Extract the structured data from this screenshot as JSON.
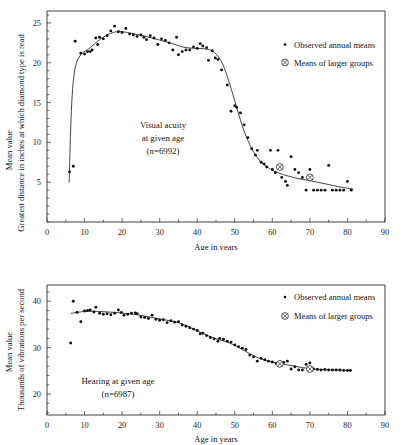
{
  "figure": {
    "background": "#ffffff",
    "ink": "#1a1a1a"
  },
  "legend": {
    "observed_label": "Observed annual means",
    "group_label": "Means of larger groups",
    "observed_icon": "small-dot-icon",
    "group_icon": "circled-cross-icon"
  },
  "panels": [
    {
      "id": "visual-acuity",
      "annotation_lines": [
        "Visual acuity",
        "at given age",
        "(n=6992)"
      ],
      "ylabel_outer": "Mean value",
      "ylabel_inner": "Greatest distance in inches at which diamond type is read",
      "xlabel": "Age in years",
      "x_ticks": [
        "0",
        "10",
        "20",
        "30",
        "40",
        "50",
        "60",
        "70",
        "80",
        "90"
      ],
      "y_ticks": [
        "5",
        "10",
        "15",
        "20",
        "25"
      ]
    },
    {
      "id": "hearing",
      "annotation_lines": [
        "Hearing at given age",
        "(n=6987)"
      ],
      "ylabel_outer": "Mean value",
      "ylabel_inner": "Thousands of vibrations per second",
      "xlabel": "Age in years",
      "x_ticks": [
        "0",
        "10",
        "20",
        "30",
        "40",
        "50",
        "60",
        "70",
        "80",
        "90"
      ],
      "y_ticks": [
        "20",
        "30",
        "40"
      ]
    }
  ],
  "chart_data": [
    {
      "type": "scatter",
      "title": "Visual acuity at given age (n=6992)",
      "xlabel": "Age in years",
      "ylabel": "Greatest distance in inches at which diamond type is read",
      "ylabel_secondary": "Mean value",
      "xlim": [
        0,
        90
      ],
      "ylim": [
        0,
        26.5
      ],
      "xticks": [
        0,
        10,
        20,
        30,
        40,
        50,
        60,
        70,
        80,
        90
      ],
      "yticks": [
        5,
        10,
        15,
        20,
        25
      ],
      "minor_tick_step_x": 5,
      "minor_tick_step_y": 1,
      "grid": false,
      "legend": [
        "Observed annual means",
        "Means of larger groups"
      ],
      "legend_position": "upper-right-inside",
      "series": [
        {
          "name": "Observed annual means",
          "marker": "dot",
          "points": [
            [
              6.0,
              6.3
            ],
            [
              7.0,
              7.0
            ],
            [
              7.5,
              22.7
            ],
            [
              9.0,
              21.2
            ],
            [
              10.0,
              21.1
            ],
            [
              10.8,
              21.4
            ],
            [
              11.5,
              21.4
            ],
            [
              12.0,
              21.6
            ],
            [
              13.0,
              23.1
            ],
            [
              13.5,
              22.3
            ],
            [
              14.0,
              23.2
            ],
            [
              15.0,
              23.0
            ],
            [
              16.0,
              23.4
            ],
            [
              17.0,
              24.0
            ],
            [
              18.0,
              24.6
            ],
            [
              19.0,
              23.9
            ],
            [
              20.0,
              23.8
            ],
            [
              21.0,
              24.3
            ],
            [
              22.0,
              23.6
            ],
            [
              23.0,
              23.5
            ],
            [
              24.0,
              23.3
            ],
            [
              25.0,
              23.5
            ],
            [
              25.8,
              23.2
            ],
            [
              26.5,
              22.9
            ],
            [
              27.5,
              23.4
            ],
            [
              28.5,
              23.1
            ],
            [
              29.5,
              22.3
            ],
            [
              30.5,
              23.0
            ],
            [
              31.5,
              22.8
            ],
            [
              32.5,
              22.5
            ],
            [
              33.5,
              21.6
            ],
            [
              34.5,
              23.2
            ],
            [
              35.0,
              21.0
            ],
            [
              36.0,
              21.4
            ],
            [
              37.0,
              21.6
            ],
            [
              38.0,
              21.6
            ],
            [
              39.0,
              22.0
            ],
            [
              40.0,
              21.8
            ],
            [
              40.8,
              22.4
            ],
            [
              41.5,
              22.1
            ],
            [
              42.5,
              21.9
            ],
            [
              43.0,
              20.3
            ],
            [
              44.0,
              21.5
            ],
            [
              44.8,
              20.6
            ],
            [
              45.5,
              20.4
            ],
            [
              46.5,
              19.1
            ],
            [
              48.0,
              17.2
            ],
            [
              49.0,
              13.9
            ],
            [
              50.0,
              14.6
            ],
            [
              50.5,
              14.4
            ],
            [
              51.5,
              13.7
            ],
            [
              52.5,
              12.2
            ],
            [
              53.5,
              10.6
            ],
            [
              54.5,
              9.2
            ],
            [
              55.5,
              8.4
            ],
            [
              56.0,
              9.0
            ],
            [
              57.0,
              7.5
            ],
            [
              57.8,
              7.3
            ],
            [
              58.5,
              6.9
            ],
            [
              59.5,
              9.0
            ],
            [
              60.0,
              6.6
            ],
            [
              60.8,
              6.2
            ],
            [
              61.5,
              9.0
            ],
            [
              62.5,
              5.6
            ],
            [
              63.5,
              5.1
            ],
            [
              64.0,
              4.6
            ],
            [
              65.0,
              8.2
            ],
            [
              66.0,
              6.6
            ],
            [
              67.0,
              6.2
            ],
            [
              68.0,
              5.6
            ],
            [
              69.0,
              4.0
            ],
            [
              70.0,
              6.6
            ],
            [
              71.0,
              4.0
            ],
            [
              72.0,
              4.0
            ],
            [
              73.0,
              4.0
            ],
            [
              74.0,
              4.0
            ],
            [
              75.0,
              7.1
            ],
            [
              76.0,
              4.0
            ],
            [
              77.0,
              4.0
            ],
            [
              78.0,
              4.0
            ],
            [
              79.0,
              4.0
            ],
            [
              80.0,
              5.1
            ],
            [
              81.0,
              4.0
            ]
          ]
        },
        {
          "name": "Means of larger groups",
          "marker": "circled-cross",
          "points": [
            [
              62.0,
              6.9
            ],
            [
              70.0,
              5.6
            ]
          ]
        }
      ],
      "fitted_curve": [
        [
          5.9,
          5.0
        ],
        [
          6.1,
          8.5
        ],
        [
          6.4,
          13.0
        ],
        [
          6.8,
          16.6
        ],
        [
          7.3,
          18.8
        ],
        [
          8.0,
          20.2
        ],
        [
          9.0,
          21.0
        ],
        [
          10.0,
          21.4
        ],
        [
          11.0,
          21.7
        ],
        [
          12.0,
          22.1
        ],
        [
          13.0,
          22.5
        ],
        [
          14.0,
          22.9
        ],
        [
          15.0,
          23.2
        ],
        [
          16.0,
          23.5
        ],
        [
          17.0,
          23.7
        ],
        [
          18.0,
          23.85
        ],
        [
          19.0,
          23.9
        ],
        [
          20.0,
          23.9
        ],
        [
          22.0,
          23.75
        ],
        [
          24.0,
          23.55
        ],
        [
          26.0,
          23.35
        ],
        [
          28.0,
          23.1
        ],
        [
          30.0,
          22.85
        ],
        [
          32.0,
          22.6
        ],
        [
          34.0,
          22.3
        ],
        [
          36.0,
          22.0
        ],
        [
          38.0,
          21.85
        ],
        [
          40.0,
          21.8
        ],
        [
          42.0,
          21.75
        ],
        [
          44.0,
          21.5
        ],
        [
          45.0,
          21.1
        ],
        [
          46.0,
          20.5
        ],
        [
          47.0,
          19.6
        ],
        [
          48.0,
          18.3
        ],
        [
          49.0,
          16.8
        ],
        [
          50.0,
          15.2
        ],
        [
          51.0,
          13.6
        ],
        [
          52.0,
          12.1
        ],
        [
          53.0,
          10.8
        ],
        [
          54.0,
          9.7
        ],
        [
          55.0,
          8.8
        ],
        [
          56.0,
          8.1
        ],
        [
          57.0,
          7.5
        ],
        [
          58.0,
          7.1
        ],
        [
          59.0,
          6.8
        ],
        [
          60.0,
          6.5
        ],
        [
          62.0,
          6.1
        ],
        [
          64.0,
          5.8
        ],
        [
          66.0,
          5.55
        ],
        [
          68.0,
          5.35
        ],
        [
          70.0,
          5.2
        ],
        [
          72.0,
          5.0
        ],
        [
          74.0,
          4.8
        ],
        [
          76.0,
          4.6
        ],
        [
          78.0,
          4.4
        ],
        [
          80.0,
          4.25
        ],
        [
          81.5,
          4.15
        ]
      ]
    },
    {
      "type": "scatter",
      "title": "Hearing at given age (n=6987)",
      "xlabel": "Age in years",
      "ylabel": "Thousands of vibrations per second",
      "ylabel_secondary": "Mean value",
      "xlim": [
        0,
        90
      ],
      "ylim": [
        15.5,
        43.5
      ],
      "xticks": [
        0,
        10,
        20,
        30,
        40,
        50,
        60,
        70,
        80,
        90
      ],
      "yticks": [
        20,
        30,
        40
      ],
      "minor_tick_step_x": 5,
      "minor_tick_step_y": 2,
      "grid": false,
      "legend": [
        "Observed annual means",
        "Means of larger groups"
      ],
      "legend_position": "upper-right-inside",
      "series": [
        {
          "name": "Observed annual means",
          "marker": "dot",
          "points": [
            [
              6.3,
              31.0
            ],
            [
              7.0,
              40.0
            ],
            [
              8.0,
              37.6
            ],
            [
              9.0,
              35.6
            ],
            [
              10.0,
              37.9
            ],
            [
              10.8,
              38.0
            ],
            [
              11.5,
              38.1
            ],
            [
              12.5,
              37.7
            ],
            [
              13.0,
              38.7
            ],
            [
              14.0,
              37.4
            ],
            [
              15.0,
              37.2
            ],
            [
              16.0,
              37.3
            ],
            [
              17.0,
              37.1
            ],
            [
              18.0,
              37.4
            ],
            [
              19.0,
              38.1
            ],
            [
              19.8,
              37.6
            ],
            [
              20.5,
              37.0
            ],
            [
              21.5,
              37.2
            ],
            [
              22.5,
              37.4
            ],
            [
              23.5,
              37.5
            ],
            [
              24.0,
              37.3
            ],
            [
              25.0,
              36.6
            ],
            [
              26.0,
              36.5
            ],
            [
              27.0,
              36.3
            ],
            [
              28.0,
              37.0
            ],
            [
              29.0,
              36.1
            ],
            [
              30.0,
              35.9
            ],
            [
              31.0,
              36.0
            ],
            [
              32.0,
              35.4
            ],
            [
              33.0,
              35.8
            ],
            [
              34.0,
              35.5
            ],
            [
              35.0,
              35.6
            ],
            [
              36.0,
              34.9
            ],
            [
              37.0,
              34.6
            ],
            [
              38.0,
              34.3
            ],
            [
              39.0,
              34.0
            ],
            [
              40.0,
              33.7
            ],
            [
              40.8,
              33.0
            ],
            [
              41.5,
              33.1
            ],
            [
              42.5,
              32.6
            ],
            [
              43.5,
              32.2
            ],
            [
              44.5,
              31.9
            ],
            [
              45.5,
              31.4
            ],
            [
              46.0,
              32.0
            ],
            [
              47.0,
              31.8
            ],
            [
              48.0,
              31.4
            ],
            [
              49.0,
              31.2
            ],
            [
              50.0,
              30.6
            ],
            [
              51.0,
              30.2
            ],
            [
              52.0,
              29.9
            ],
            [
              53.0,
              29.6
            ],
            [
              54.0,
              28.4
            ],
            [
              55.0,
              28.0
            ],
            [
              56.0,
              27.1
            ],
            [
              57.0,
              27.7
            ],
            [
              58.0,
              27.4
            ],
            [
              59.0,
              27.1
            ],
            [
              60.0,
              26.9
            ],
            [
              61.0,
              26.6
            ],
            [
              62.0,
              27.0
            ],
            [
              63.0,
              26.8
            ],
            [
              64.0,
              27.1
            ],
            [
              65.0,
              25.4
            ],
            [
              66.0,
              25.9
            ],
            [
              67.0,
              25.2
            ],
            [
              68.0,
              25.2
            ],
            [
              69.0,
              26.4
            ],
            [
              70.0,
              26.7
            ],
            [
              71.0,
              25.4
            ],
            [
              72.0,
              25.3
            ],
            [
              73.0,
              25.2
            ],
            [
              74.0,
              25.3
            ],
            [
              75.0,
              25.2
            ],
            [
              76.0,
              25.2
            ],
            [
              77.0,
              25.2
            ],
            [
              78.0,
              25.2
            ],
            [
              79.0,
              25.1
            ],
            [
              80.0,
              25.1
            ],
            [
              80.8,
              25.1
            ]
          ]
        },
        {
          "name": "Means of larger groups",
          "marker": "circled-cross",
          "points": [
            [
              62.0,
              26.5
            ],
            [
              70.0,
              25.4
            ]
          ]
        }
      ],
      "fitted_curve": [
        [
          6.5,
          37.4
        ],
        [
          8.0,
          37.6
        ],
        [
          10.0,
          37.8
        ],
        [
          12.0,
          37.85
        ],
        [
          14.0,
          37.8
        ],
        [
          16.0,
          37.7
        ],
        [
          18.0,
          37.6
        ],
        [
          20.0,
          37.45
        ],
        [
          22.0,
          37.3
        ],
        [
          24.0,
          37.1
        ],
        [
          26.0,
          36.8
        ],
        [
          28.0,
          36.5
        ],
        [
          30.0,
          36.2
        ],
        [
          32.0,
          35.9
        ],
        [
          34.0,
          35.6
        ],
        [
          36.0,
          35.1
        ],
        [
          38.0,
          34.4
        ],
        [
          40.0,
          33.6
        ],
        [
          42.0,
          32.9
        ],
        [
          44.0,
          32.2
        ],
        [
          46.0,
          31.7
        ],
        [
          48.0,
          31.2
        ],
        [
          50.0,
          30.5
        ],
        [
          52.0,
          29.6
        ],
        [
          54.0,
          28.7
        ],
        [
          56.0,
          27.9
        ],
        [
          58.0,
          27.3
        ],
        [
          60.0,
          26.9
        ],
        [
          62.0,
          26.6
        ],
        [
          64.0,
          26.3
        ],
        [
          66.0,
          26.0
        ],
        [
          68.0,
          25.7
        ],
        [
          70.0,
          25.5
        ],
        [
          72.0,
          25.35
        ],
        [
          74.0,
          25.25
        ],
        [
          76.0,
          25.2
        ],
        [
          78.0,
          25.15
        ],
        [
          80.5,
          25.1
        ]
      ]
    }
  ]
}
